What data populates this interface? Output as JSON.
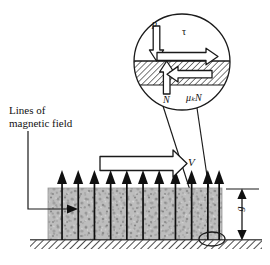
{
  "figure": {
    "type": "physics-free-body-diagram",
    "background_color": "#ffffff",
    "ink_color": "#1a1a1a"
  },
  "annotations": {
    "lines_of_field": "Lines of\nmagnetic field",
    "velocity": "V",
    "gap": "g"
  },
  "inset": {
    "name": "contact-detail-circle",
    "center_x": 182,
    "center_y": 62,
    "radius": 49,
    "forces": [
      {
        "symbol": "p",
        "direction": "down",
        "name": "applied-pressure-force"
      },
      {
        "symbol": "τ",
        "direction": "right",
        "name": "shear-stress-force"
      },
      {
        "symbol": "N",
        "direction": "up",
        "name": "normal-force"
      },
      {
        "symbol": "μₖN",
        "direction": "left",
        "name": "kinetic-friction-force"
      }
    ],
    "hatch_band": {
      "y_top": 61,
      "y_bottom": 85,
      "label": "contact-surface-hatching"
    }
  },
  "body": {
    "name": "speckled-block",
    "left": 48,
    "right": 222,
    "top": 188,
    "bottom": 240,
    "fill": "#b9b9b9",
    "texture": "speckled-granular"
  },
  "ground": {
    "name": "hatched-ground",
    "left": 30,
    "right": 262,
    "top": 240,
    "bottom": 249,
    "hatch": "diagonal"
  },
  "field_arrows": {
    "count": 11,
    "first_x": 62,
    "spacing": 16.2,
    "tail_y": 240,
    "head_y": 172,
    "style": "solid-filled"
  },
  "velocity_arrow": {
    "x1": 100,
    "x2": 185,
    "y": 163,
    "style": "hollow-outline",
    "direction": "right"
  },
  "dimension": {
    "x": 242,
    "y_top": 189,
    "y_bottom": 240,
    "tick_left": 226,
    "tick_right": 258,
    "style": "double-headed"
  },
  "marker_ellipse": {
    "cx": 212,
    "cy": 239,
    "rx": 13,
    "ry": 7,
    "name": "zoom-region-marker"
  },
  "leaders": [
    {
      "name": "inset-connector-left",
      "from": [
        166,
        108
      ],
      "to": [
        205,
        236
      ]
    },
    {
      "name": "inset-connector-right",
      "from": [
        196,
        108
      ],
      "to": [
        216,
        236
      ]
    },
    {
      "name": "field-label-leader",
      "path": "M 28,131 L 28,209 L 75,209"
    }
  ]
}
